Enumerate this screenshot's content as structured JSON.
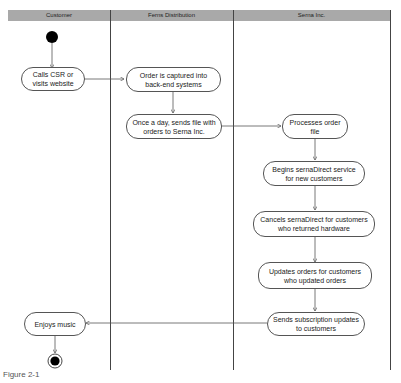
{
  "diagram": {
    "type": "UML activity diagram (swimlanes)",
    "lanes": [
      {
        "id": "customer",
        "title": "Customer"
      },
      {
        "id": "ferns",
        "title": "Ferns Distribution"
      },
      {
        "id": "serna",
        "title": "Serna Inc."
      }
    ],
    "activities": [
      {
        "id": "a1",
        "lane": "customer",
        "label": "Calls CSR or visits website"
      },
      {
        "id": "a2",
        "lane": "ferns",
        "label": "Order is captured into back-end systems"
      },
      {
        "id": "a3",
        "lane": "ferns",
        "label": "Once a day, sends file with orders to Serna Inc."
      },
      {
        "id": "a4",
        "lane": "serna",
        "label": "Processes order file"
      },
      {
        "id": "a5",
        "lane": "serna",
        "label": "Begins sernaDirect service for new customers"
      },
      {
        "id": "a6",
        "lane": "serna",
        "label": "Cancels sernaDirect for customers who returned hardware"
      },
      {
        "id": "a7",
        "lane": "serna",
        "label": "Updates orders for customers who updated orders"
      },
      {
        "id": "a8",
        "lane": "serna",
        "label": "Sends subscription updates to customers"
      },
      {
        "id": "a9",
        "lane": "customer",
        "label": "Enjoys music"
      }
    ],
    "flows": [
      [
        "start",
        "a1"
      ],
      [
        "a1",
        "a2"
      ],
      [
        "a2",
        "a3"
      ],
      [
        "a3",
        "a4"
      ],
      [
        "a4",
        "a5"
      ],
      [
        "a5",
        "a6"
      ],
      [
        "a6",
        "a7"
      ],
      [
        "a7",
        "a8"
      ],
      [
        "a8",
        "a9"
      ],
      [
        "a9",
        "end"
      ]
    ],
    "caption": "Figure 2-1"
  }
}
